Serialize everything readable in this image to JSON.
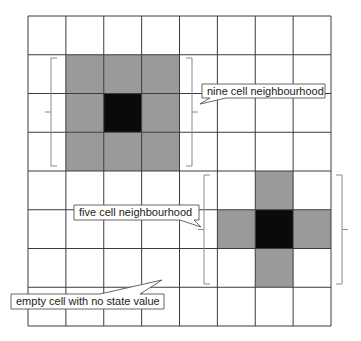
{
  "diagram": {
    "grid": {
      "columns": 8,
      "rows": 8
    },
    "colors": {
      "background": "#ffffff",
      "grid_line": "#3c3c3c",
      "neighbour": "#9a9a9a",
      "center": "#0a0a0a",
      "bracket": "#8a8a8a",
      "callout_border": "#555555",
      "callout_fill": "#ffffff"
    },
    "neighbourhoods": [
      {
        "name": "nine-cell-neighbourhood",
        "center": [
          2,
          2
        ],
        "neighbours": [
          [
            1,
            1
          ],
          [
            2,
            1
          ],
          [
            3,
            1
          ],
          [
            1,
            2
          ],
          [
            3,
            2
          ],
          [
            1,
            3
          ],
          [
            2,
            3
          ],
          [
            3,
            3
          ]
        ]
      },
      {
        "name": "five-cell-neighbourhood",
        "center": [
          6,
          5
        ],
        "neighbours": [
          [
            6,
            4
          ],
          [
            5,
            5
          ],
          [
            7,
            5
          ],
          [
            6,
            6
          ]
        ]
      }
    ],
    "callouts": [
      {
        "name": "nine-cell-label",
        "text": "nine cell neighbourhood"
      },
      {
        "name": "five-cell-label",
        "text": "five cell neighbourhood"
      },
      {
        "name": "empty-cell-label",
        "text": "empty cell with no state value"
      }
    ]
  }
}
